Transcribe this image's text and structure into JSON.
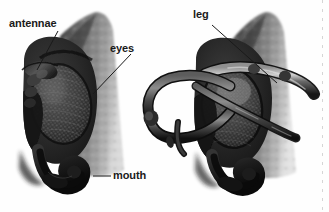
{
  "figure": {
    "background_color": "#fefefe",
    "label_color": "#1a1a1a",
    "leader_line_color": "#1a1a1a",
    "width": 329,
    "height": 212,
    "specimen_dark": "#1c1c1c",
    "specimen_mid": "#5a5a5a",
    "specimen_light": "#9a9a9a"
  },
  "labels": {
    "antennae": "antennae",
    "eyes": "eyes",
    "mouth": "mouth",
    "leg": "leg"
  },
  "panels": [
    {
      "name": "left-specimen",
      "callouts": [
        "antennae",
        "eyes",
        "mouth"
      ]
    },
    {
      "name": "right-specimen",
      "callouts": [
        "leg"
      ]
    }
  ]
}
